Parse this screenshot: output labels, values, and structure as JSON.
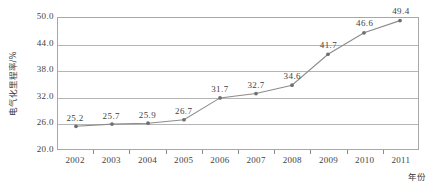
{
  "chart_data": {
    "type": "line",
    "title": "",
    "subtitle": "",
    "xlabel": "年份",
    "ylabel": "电气化里程率/%",
    "categories": [
      "2002",
      "2003",
      "2004",
      "2005",
      "2006",
      "2007",
      "2008",
      "2009",
      "2010",
      "2011"
    ],
    "values": [
      25.2,
      25.7,
      25.9,
      26.7,
      31.7,
      32.7,
      34.6,
      41.7,
      46.6,
      49.4
    ],
    "point_labels": [
      "25.2",
      "25.7",
      "25.9",
      "26.7",
      "31.7",
      "32.7",
      "34.6",
      "41.7",
      "46.6",
      "49.4"
    ],
    "ylim": [
      20.0,
      50.0
    ],
    "ytick_values": [
      20.0,
      26.0,
      32.0,
      38.0,
      44.0,
      50.0
    ],
    "ytick_labels": [
      "20.0",
      "26.0",
      "32.0",
      "38.0",
      "44.0",
      "50.0"
    ],
    "grid": true,
    "legend": false,
    "legend_position": "none",
    "series_name": "电气化里程率",
    "marker": "circle",
    "colors": {
      "line": "#8c8c8c",
      "marker": "#6f6f6f",
      "grid": "#b5b5b5",
      "axis": "#a8a8a8",
      "text": "#3f3f3f",
      "background": "#ffffff"
    }
  }
}
